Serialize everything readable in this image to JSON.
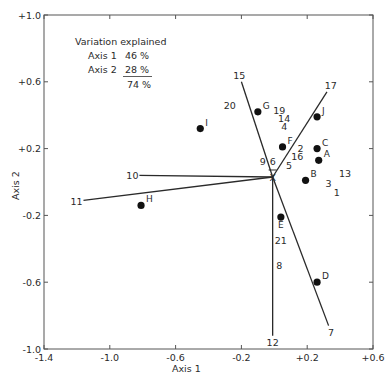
{
  "chart_data": {
    "type": "scatter",
    "title": "",
    "xlabel": "Axis 1",
    "ylabel": "Axis 2",
    "xlim": [
      -1.4,
      0.6
    ],
    "ylim": [
      -1.0,
      1.0
    ],
    "grid": false,
    "x_ticks": [
      -1.4,
      -1.0,
      -0.6,
      -0.2,
      0.2,
      0.6
    ],
    "x_tick_labels": [
      "-1.4",
      "-1.0",
      "-0.6",
      "-0.2",
      "+0.2",
      "+0.6"
    ],
    "y_ticks": [
      1.0,
      0.6,
      0.2,
      -0.2,
      -0.6,
      -1.0
    ],
    "y_tick_labels": [
      "+1.0",
      "+0.6",
      "+0.2",
      "-0.2",
      "-0.6",
      "-1.0"
    ],
    "annotation": {
      "heading": "Variation explained",
      "rows": [
        {
          "label": "Axis 1",
          "value": "46 %"
        },
        {
          "label": "Axis 2",
          "value": "28 %"
        }
      ],
      "total": "74 %"
    },
    "centroid": {
      "label": "X̄",
      "x": -0.01,
      "y": 0.03
    },
    "points": [
      {
        "label": "A",
        "x": 0.27,
        "y": 0.13
      },
      {
        "label": "B",
        "x": 0.19,
        "y": 0.01
      },
      {
        "label": "C",
        "x": 0.26,
        "y": 0.2
      },
      {
        "label": "D",
        "x": 0.26,
        "y": -0.6
      },
      {
        "label": "E",
        "x": 0.04,
        "y": -0.21
      },
      {
        "label": "F",
        "x": 0.05,
        "y": 0.21
      },
      {
        "label": "G",
        "x": -0.1,
        "y": 0.42
      },
      {
        "label": "H",
        "x": -0.81,
        "y": -0.14
      },
      {
        "label": "I",
        "x": -0.45,
        "y": 0.32
      },
      {
        "label": "J",
        "x": 0.26,
        "y": 0.39
      }
    ],
    "vectors": [
      {
        "label": "15",
        "x": -0.2,
        "y": 0.6
      },
      {
        "label": "17",
        "x": 0.32,
        "y": 0.54
      },
      {
        "label": "10",
        "x": -0.82,
        "y": 0.04
      },
      {
        "label": "11",
        "x": -1.16,
        "y": -0.11
      },
      {
        "label": "12",
        "x": -0.01,
        "y": -0.92
      },
      {
        "label": "7",
        "x": 0.33,
        "y": -0.86
      }
    ],
    "variable_labels": [
      {
        "label": "20",
        "x": -0.27,
        "y": 0.46
      },
      {
        "label": "19",
        "x": 0.03,
        "y": 0.43
      },
      {
        "label": "14",
        "x": 0.06,
        "y": 0.38
      },
      {
        "label": "4",
        "x": 0.06,
        "y": 0.33
      },
      {
        "label": "2",
        "x": 0.16,
        "y": 0.2
      },
      {
        "label": "16",
        "x": 0.14,
        "y": 0.15
      },
      {
        "label": "5",
        "x": 0.09,
        "y": 0.1
      },
      {
        "label": "9",
        "x": -0.07,
        "y": 0.12
      },
      {
        "label": "6",
        "x": -0.01,
        "y": 0.12
      },
      {
        "label": "13",
        "x": 0.43,
        "y": 0.05
      },
      {
        "label": "3",
        "x": 0.33,
        "y": -0.01
      },
      {
        "label": "1",
        "x": 0.38,
        "y": -0.06
      },
      {
        "label": "21",
        "x": 0.04,
        "y": -0.35
      },
      {
        "label": "8",
        "x": 0.03,
        "y": -0.5
      }
    ]
  }
}
